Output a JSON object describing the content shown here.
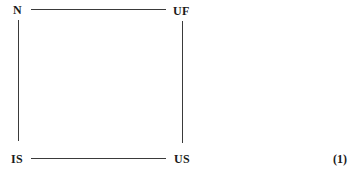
{
  "diagram": {
    "type": "commutative-square",
    "nodes": {
      "top_left": "N",
      "top_right": "UF",
      "bottom_left": "IS",
      "bottom_right": "US"
    },
    "edges": [
      {
        "from": "N",
        "to": "UF",
        "orientation": "horizontal"
      },
      {
        "from": "N",
        "to": "IS",
        "orientation": "vertical"
      },
      {
        "from": "UF",
        "to": "US",
        "orientation": "vertical"
      },
      {
        "from": "IS",
        "to": "US",
        "orientation": "horizontal"
      }
    ],
    "equation_number": "(1)"
  }
}
